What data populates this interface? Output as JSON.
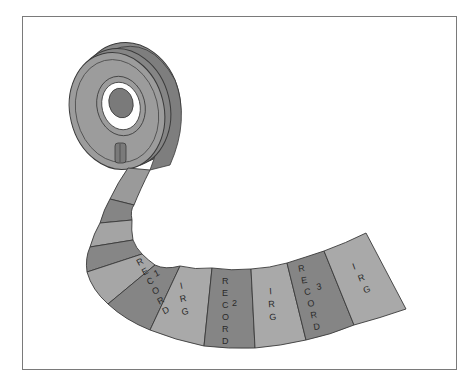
{
  "diagram": {
    "colors": {
      "record": "#858585",
      "irg": "#a8a8a8",
      "reel_face": "#9a9a9a",
      "reel_rim": "#8a8a8a",
      "hub": "#7c7c7c",
      "outline": "#3a3a3a"
    },
    "segments": [
      {
        "type": "record",
        "label": "RECORD",
        "number": "1"
      },
      {
        "type": "irg",
        "label": "IRG"
      },
      {
        "type": "record",
        "label": "RECORD",
        "number": "2"
      },
      {
        "type": "irg",
        "label": "IRG"
      },
      {
        "type": "record",
        "label": "RECORD",
        "number": "3"
      },
      {
        "type": "irg",
        "label": "IRG"
      }
    ],
    "labels": {
      "rec1_letters": [
        "R",
        "E",
        "C",
        "O",
        "R",
        "D"
      ],
      "rec1_num": "1",
      "irg1_letters": [
        "I",
        "R",
        "G"
      ],
      "rec2_letters": [
        "R",
        "E",
        "C",
        "O",
        "R",
        "D"
      ],
      "rec2_num": "2",
      "irg2_letters": [
        "I",
        "R",
        "G"
      ],
      "rec3_letters": [
        "R",
        "E",
        "C",
        "O",
        "R",
        "D"
      ],
      "rec3_num": "3",
      "irg3_letters": [
        "I",
        "R",
        "G"
      ]
    }
  }
}
